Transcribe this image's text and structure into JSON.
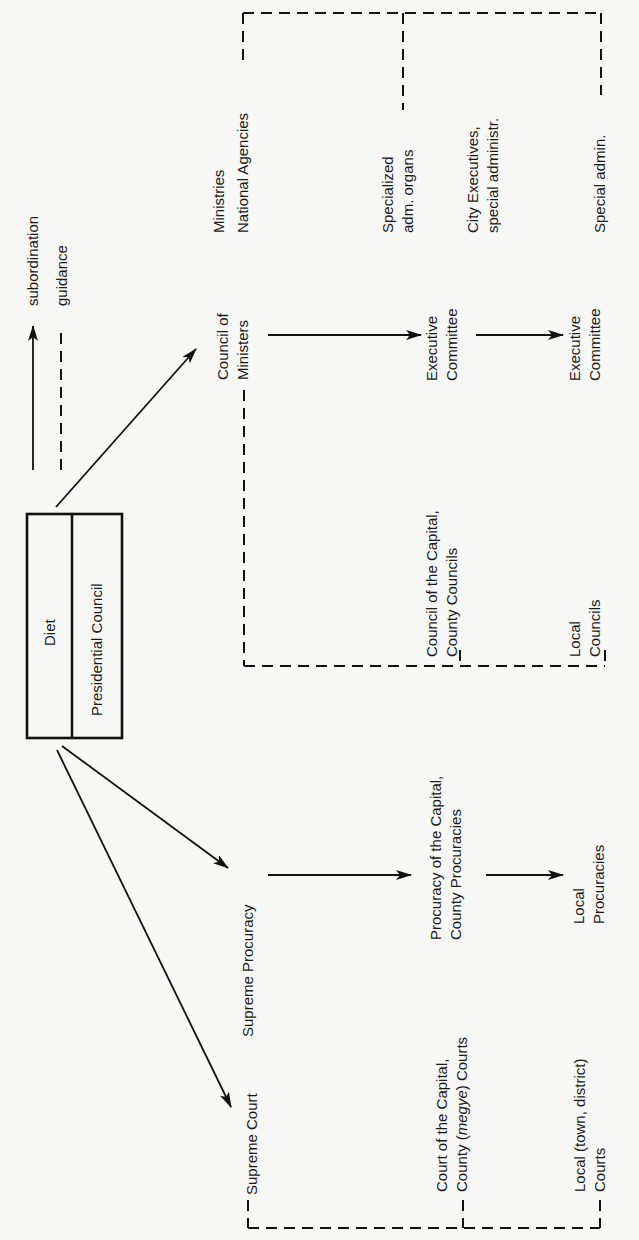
{
  "legend": {
    "subordination": "subordination",
    "guidance": "guidance"
  },
  "top_box": {
    "diet": "Diet",
    "presidential_council": "Presidential Council"
  },
  "administration": {
    "council_of_ministers": [
      "Council of",
      "Ministers"
    ],
    "ministries": [
      "Ministries",
      "National Agencies"
    ],
    "executive_committee_county": [
      "Executive",
      "Committee"
    ],
    "specialized_adm_organs": [
      "Specialized",
      "adm. organs"
    ],
    "council_capital_county": [
      "Council of the Capital,",
      "County Councils"
    ],
    "city_executives": [
      "City Executives,",
      "special administr."
    ],
    "executive_committee_local": [
      "Executive",
      "Committee"
    ],
    "special_admin": "Special admin.",
    "local_councils": [
      "Local",
      "Councils"
    ]
  },
  "procuracy": {
    "supreme_procuracy": "Supreme Procuracy",
    "county_procuracies": [
      "Procuracy of the Capital,",
      "County Procuracies"
    ],
    "local_procuracies": [
      "Local",
      "Procuracies"
    ]
  },
  "courts": {
    "supreme_court": "Supreme Court",
    "county_courts_line1": "Court of the Capital,",
    "county_courts_line2_a": "County (",
    "county_courts_line2_italic": "megye",
    "county_courts_line2_b": ") Courts",
    "local_courts": [
      "Local (town, district)",
      "Courts"
    ]
  },
  "colors": {
    "ink": "#111111",
    "paper": "#f7f7f5"
  }
}
